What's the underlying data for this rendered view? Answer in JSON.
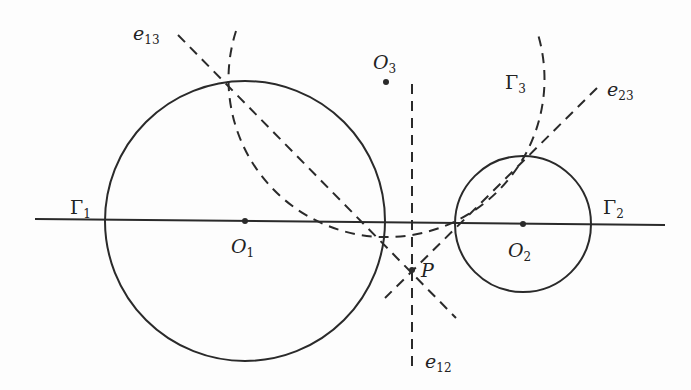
{
  "figure": {
    "stroke_color": "#2a2a2a",
    "background": "#fdfdfd"
  },
  "labels": {
    "gamma1": {
      "base": "Γ",
      "sub": "1"
    },
    "gamma2": {
      "base": "Γ",
      "sub": "2"
    },
    "gamma3": {
      "base": "Γ",
      "sub": "3"
    },
    "o1": {
      "base": "O",
      "sub": "1"
    },
    "o2": {
      "base": "O",
      "sub": "2"
    },
    "o3": {
      "base": "O",
      "sub": "3"
    },
    "p": {
      "base": "P"
    },
    "e12": {
      "base": "e",
      "sub": "12"
    },
    "e13": {
      "base": "e",
      "sub": "13"
    },
    "e23": {
      "base": "e",
      "sub": "23"
    }
  },
  "geometry": {
    "circle1": {
      "cx": 245,
      "cy": 221,
      "r": 140
    },
    "circle2": {
      "cx": 523,
      "cy": 224,
      "r": 68
    },
    "circle3_arc": {
      "cx": 386,
      "cy": 82,
      "r": 158
    },
    "center_line": {
      "x1": 35,
      "y1": 219,
      "x2": 665,
      "y2": 225
    },
    "point_P": {
      "x": 412,
      "y": 270
    },
    "point_O3": {
      "x": 386,
      "y": 82
    }
  }
}
